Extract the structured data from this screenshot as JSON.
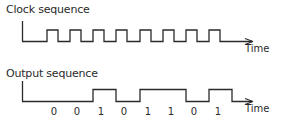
{
  "clock": {
    "title": "Clock sequence",
    "axis_label": "Time",
    "pulse_count": 9
  },
  "output": {
    "title": "Output sequence",
    "axis_label": "Time",
    "bits": [
      "0",
      "0",
      "1",
      "0",
      "1",
      "1",
      "0",
      "1"
    ]
  },
  "colors": {
    "line": "#2a2a2a",
    "background": "#ffffff"
  }
}
